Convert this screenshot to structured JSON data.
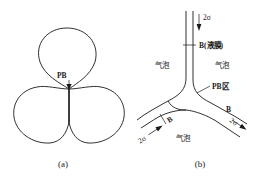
{
  "figure": {
    "background_color": "#ffffff",
    "line_color": "#1a1a1a",
    "panels": [
      {
        "id": "a",
        "caption": "(a)",
        "description": "three-bubble-plateau-border",
        "labels": [
          {
            "name": "pb-label",
            "text": "PB"
          }
        ]
      },
      {
        "id": "b",
        "caption": "(b)",
        "description": "plateau-border-detail-junction",
        "labels": [
          {
            "name": "tension-top",
            "text": "2σ"
          },
          {
            "name": "film-label",
            "text": "B(液膜)"
          },
          {
            "name": "bubble-left",
            "text": "气泡"
          },
          {
            "name": "bubble-right",
            "text": "气泡"
          },
          {
            "name": "bubble-bottom",
            "text": "气泡"
          },
          {
            "name": "pb-zone",
            "text": "PB区"
          },
          {
            "name": "film-right",
            "text": "B"
          },
          {
            "name": "film-left",
            "text": "B"
          },
          {
            "name": "tension-right",
            "text": "2σ"
          },
          {
            "name": "tension-left",
            "text": "2σ"
          }
        ]
      }
    ]
  },
  "panel_a": {
    "caption": "(a)",
    "pb_label": "PB"
  },
  "panel_b": {
    "caption": "(b)",
    "tension_top": "2σ",
    "film_top_label": "B(液膜)",
    "bubble_left": "气泡",
    "bubble_right": "气泡",
    "bubble_bottom": "气泡",
    "pb_zone_label": "PB区",
    "film_right_label": "B",
    "film_left_label": "B",
    "tension_right": "2σ",
    "tension_left": "2σ"
  }
}
